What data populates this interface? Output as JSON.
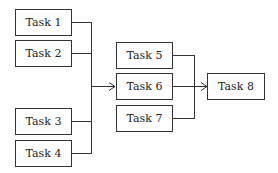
{
  "diagram": {
    "type": "task-dependency-flow",
    "colors": {
      "line": "#333333",
      "text": "#222222",
      "background": "#ffffff"
    },
    "nodes": [
      {
        "id": "task1",
        "label": "Task 1"
      },
      {
        "id": "task2",
        "label": "Task 2"
      },
      {
        "id": "task3",
        "label": "Task 3"
      },
      {
        "id": "task4",
        "label": "Task 4"
      },
      {
        "id": "task5",
        "label": "Task 5"
      },
      {
        "id": "task6",
        "label": "Task 6"
      },
      {
        "id": "task7",
        "label": "Task 7"
      },
      {
        "id": "task8",
        "label": "Task 8"
      }
    ],
    "edges": [
      {
        "from": [
          "task1",
          "task2",
          "task3",
          "task4"
        ],
        "to": "task6",
        "style": "merge-arrow"
      },
      {
        "from": [
          "task5",
          "task6",
          "task7"
        ],
        "to": "task8",
        "style": "merge-arrow"
      }
    ]
  }
}
